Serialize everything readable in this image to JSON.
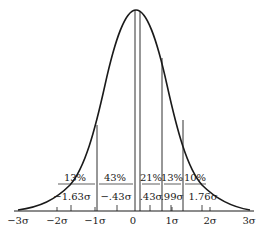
{
  "figure": {
    "type": "normal-distribution-curve",
    "axis_ticks": [
      {
        "label": "−3σ",
        "x": 18
      },
      {
        "label": "−2σ",
        "x": 57
      },
      {
        "label": "−1σ",
        "x": 95
      },
      {
        "label": "0",
        "x": 133
      },
      {
        "label": "1σ",
        "x": 172
      },
      {
        "label": "2σ",
        "x": 210
      },
      {
        "label": "3σ",
        "x": 249
      }
    ],
    "regions": [
      {
        "percent": "13%",
        "x": 72
      },
      {
        "percent": "43%",
        "x": 113
      },
      {
        "percent": "21%",
        "x": 150
      },
      {
        "percent": "13%",
        "x": 172
      },
      {
        "percent": "10%",
        "x": 194
      }
    ],
    "midpoints": [
      {
        "label": "−1.63σ",
        "x": 70
      },
      {
        "label": "−.43σ",
        "x": 116
      },
      {
        "label": ".43σ",
        "x": 150
      },
      {
        "label": ".99σ",
        "x": 171
      },
      {
        "label": "1.76σ",
        "x": 202
      }
    ],
    "caption_fragment": ""
  },
  "colors": {
    "ink": "#1a1a1a",
    "paper": "#ffffff"
  }
}
